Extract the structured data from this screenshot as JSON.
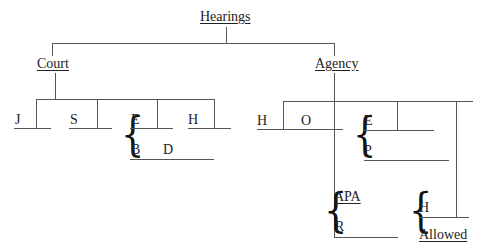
{
  "diagram": {
    "type": "tree",
    "root": {
      "label": "Hearings"
    },
    "branches": {
      "court": {
        "label": "Court",
        "children": {
          "j": "J",
          "s": "S",
          "e": "E",
          "h": "H",
          "b": "B",
          "d": "D"
        }
      },
      "agency": {
        "label": "Agency",
        "children": {
          "h": "H",
          "o": "O",
          "e": "E",
          "p": "P",
          "apa": "APA",
          "r": "R",
          "h2": "H",
          "allowed": "Allowed"
        }
      }
    },
    "brace_glyph": "{"
  }
}
